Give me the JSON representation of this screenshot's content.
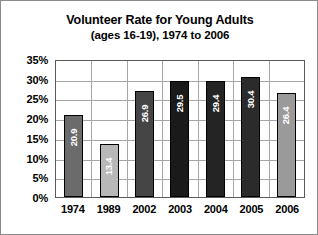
{
  "chart_data": {
    "type": "bar",
    "title": "Volunteer Rate for Young Adults",
    "subtitle": "(ages 16-19), 1974 to 2006",
    "xlabel": "",
    "ylabel": "",
    "categories": [
      "1974",
      "1989",
      "2002",
      "2003",
      "2004",
      "2005",
      "2006"
    ],
    "values": [
      20.9,
      13.4,
      26.9,
      29.5,
      29.4,
      30.4,
      26.4
    ],
    "value_labels": [
      "20.9",
      "13.4",
      "26.9",
      "29.5",
      "29.4",
      "30.4",
      "26.4"
    ],
    "bar_colors": [
      "#6b6b6b",
      "#b8b8b8",
      "#454545",
      "#1a1a1a",
      "#242424",
      "#2b2b2b",
      "#9a9a9a"
    ],
    "ylim": [
      0,
      35
    ],
    "ytick_values": [
      0,
      5,
      10,
      15,
      20,
      25,
      30,
      35
    ],
    "ytick_labels": [
      "0%",
      "5%",
      "10%",
      "15%",
      "20%",
      "25%",
      "30%",
      "35%"
    ],
    "grid": true,
    "legend": false,
    "value_label_orientation": "vertical",
    "value_label_color": "#ffffff"
  }
}
